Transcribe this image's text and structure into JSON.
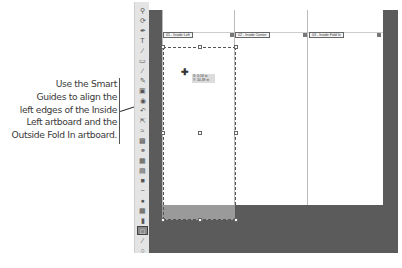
{
  "callout": {
    "lines": [
      "Use the Smart",
      "Guides to align the",
      "left edges of the Inside",
      "Left artboard and the",
      "Outside Fold In artboard."
    ]
  },
  "artboards": [
    {
      "label": "01 - Inside Left"
    },
    {
      "label": "02 - Inside Center"
    },
    {
      "label": "03 - Inside Fold In"
    }
  ],
  "smart_guide_tooltip": {
    "x": "X: 0.13 in",
    "y": "Y: 10.39 in"
  },
  "toolbar": {
    "tools": [
      "zoom-tool",
      "rotate-view-tool",
      "pen-tool",
      "type-tool",
      "line-tool",
      "rectangle-tool",
      "paintbrush-tool",
      "pencil-tool",
      "eraser-tool",
      "blob-brush-tool",
      "rotate-tool",
      "scale-tool",
      "warp-tool",
      "free-transform-tool",
      "shape-builder-tool",
      "perspective-grid-tool",
      "mesh-tool",
      "gradient-tool",
      "eyedropper-tool",
      "blend-tool",
      "symbol-sprayer-tool",
      "graph-tool",
      "artboard-tool",
      "slice-tool",
      "hand-tool"
    ],
    "active_tool": "artboard-tool"
  },
  "colors": {
    "pasteboard": "#5b5b5b",
    "toolbar_bg": "#e4e4e4",
    "selection_fill": "#9a9a9a"
  }
}
